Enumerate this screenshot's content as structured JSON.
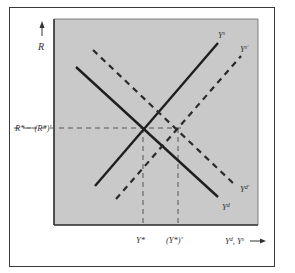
{
  "diagram": {
    "type": "supply-demand shift (IS-type goods market)",
    "colors": {
      "plot_background": "#c9c9c9",
      "frame": "#3a3a3a",
      "line": "#1e1e1e",
      "dashed_line": "#2a2a2a",
      "guide": "#555555",
      "text": "#333333"
    },
    "axes": {
      "y_label": "R",
      "x_label": "Y",
      "x_label_sup": "d",
      "x_label_sep": ", ",
      "x_label2": "Y",
      "x_label2_sup": "s",
      "x_arrow": "→"
    },
    "curves": [
      {
        "id": "Ys",
        "label": "Y",
        "sup": "s",
        "style": "solid",
        "slope": "upward"
      },
      {
        "id": "Ys_prime",
        "label": "Y",
        "sup": "s′",
        "style": "dashed",
        "slope": "upward"
      },
      {
        "id": "Yd",
        "label": "Y",
        "sup": "d",
        "style": "solid",
        "slope": "downward"
      },
      {
        "id": "Yd_prime",
        "label": "Y",
        "sup": "d′",
        "style": "dashed",
        "slope": "downward"
      }
    ],
    "y_tick": {
      "label": "R* = (R*)′"
    },
    "x_ticks": [
      {
        "label": "Y*"
      },
      {
        "label": "(Y*)′"
      }
    ]
  }
}
